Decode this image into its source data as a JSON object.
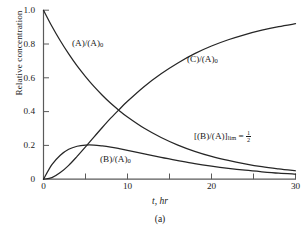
{
  "figure": {
    "caption": "(a)",
    "background": "#ffffff",
    "line_color": "#262626",
    "axis_color": "#555555"
  },
  "chart_data": {
    "type": "line",
    "title": "",
    "xlabel": "t, hr",
    "ylabel": "Relative concentration",
    "xlim": [
      0,
      30
    ],
    "ylim": [
      0,
      1.0
    ],
    "grid": false,
    "legend": "inline-labels",
    "x_ticks": [
      0,
      10,
      20,
      30
    ],
    "x_tick_labels": [
      "0",
      "10",
      "20",
      "30"
    ],
    "x_minor_ticks": [
      5,
      15,
      25
    ],
    "y_ticks": [
      0,
      0.2,
      0.4,
      0.6,
      0.8,
      1.0
    ],
    "y_tick_labels": [
      "0",
      "0.2",
      "0.4",
      "0.6",
      "0.8",
      "1.0"
    ],
    "x": [
      0,
      1,
      2,
      3,
      4,
      5,
      6,
      7,
      8,
      9,
      10,
      12,
      14,
      16,
      18,
      20,
      22,
      24,
      26,
      28,
      30
    ],
    "series": [
      {
        "name": "(A)/(A)0",
        "label": "(A)/(A)",
        "label_sub": "0",
        "values": [
          1.0,
          0.905,
          0.819,
          0.741,
          0.67,
          0.607,
          0.549,
          0.497,
          0.449,
          0.407,
          0.368,
          0.301,
          0.247,
          0.202,
          0.165,
          0.135,
          0.111,
          0.091,
          0.074,
          0.061,
          0.05
        ]
      },
      {
        "name": "(B)/(A)0",
        "label": "(B)/(A)",
        "label_sub": "0",
        "values": [
          0.0,
          0.086,
          0.142,
          0.177,
          0.195,
          0.202,
          0.202,
          0.197,
          0.19,
          0.181,
          0.171,
          0.15,
          0.129,
          0.11,
          0.092,
          0.077,
          0.064,
          0.053,
          0.044,
          0.036,
          0.03
        ]
      },
      {
        "name": "(C)/(A)0",
        "label": "(C)/(A)",
        "label_sub": "0",
        "values": [
          0.0,
          0.009,
          0.039,
          0.082,
          0.135,
          0.191,
          0.249,
          0.306,
          0.361,
          0.412,
          0.461,
          0.549,
          0.624,
          0.688,
          0.743,
          0.788,
          0.825,
          0.856,
          0.882,
          0.903,
          0.92
        ]
      }
    ],
    "annotations": [
      {
        "name": "limit-ratio",
        "text_prefix": "[(B)/(A)]",
        "text_sub": "lim",
        "text_equals": "=",
        "fraction_numerator": "1",
        "fraction_denominator": "2"
      }
    ],
    "curve_label_positions": [
      {
        "series": "(A)/(A)0",
        "x_px": 72,
        "y_px": 38
      },
      {
        "series": "(B)/(A)0",
        "x_px": 100,
        "y_px": 155
      },
      {
        "series": "(C)/(A)0",
        "x_px": 187,
        "y_px": 55
      }
    ]
  }
}
